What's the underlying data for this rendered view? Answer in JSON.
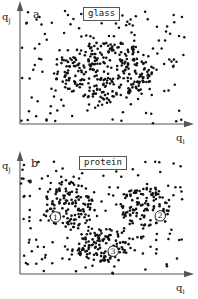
{
  "figure": {
    "background": "#ffffff",
    "dot_color": "#111111",
    "axis_color": "#555555"
  },
  "panels": [
    {
      "id": "a",
      "letter": "a",
      "tag": "glass",
      "xlabel": "q",
      "xlabel_sub": "i",
      "ylabel": "q",
      "ylabel_sub": "j"
    },
    {
      "id": "b",
      "letter": "b",
      "tag": "protein",
      "xlabel": "q",
      "xlabel_sub": "i",
      "ylabel": "q",
      "ylabel_sub": "j"
    }
  ],
  "cluster_markers": [
    {
      "label": "1",
      "panel": "b",
      "x": 52,
      "y": 212
    },
    {
      "label": "2",
      "panel": "b",
      "x": 160,
      "y": 214
    },
    {
      "label": "3",
      "panel": "b",
      "x": 111,
      "y": 257
    }
  ],
  "chart_data": {
    "type": "scatter",
    "title": "",
    "xlabel": "q_i",
    "ylabel": "q_j",
    "grid": false,
    "legend": "none",
    "axis_style": "arrow-axes-no-ticks",
    "xlim": [
      0,
      1
    ],
    "ylim": [
      0,
      1
    ],
    "panels": [
      {
        "name": "glass",
        "letter": "a",
        "description": "Sparse uniform background dots with one large dense amorphous cluster near the centre of configuration space.",
        "background_density_points": 120,
        "clusters": [
          {
            "id": "glass-central-blob",
            "label": "",
            "center": [
              0.52,
              0.46
            ],
            "radius_x": 0.3,
            "radius_y": 0.26,
            "n_points": 300
          }
        ]
      },
      {
        "name": "protein",
        "letter": "b",
        "description": "Sparse uniform background dots with three distinct dense clusters, each annotated by a circled number.",
        "background_density_points": 130,
        "clusters": [
          {
            "id": "protein-cluster-1",
            "label": "1",
            "center": [
              0.3,
              0.6
            ],
            "radius_x": 0.155,
            "radius_y": 0.195,
            "n_points": 120
          },
          {
            "id": "protein-cluster-2",
            "label": "2",
            "center": [
              0.76,
              0.585
            ],
            "radius_x": 0.155,
            "radius_y": 0.175,
            "n_points": 115
          },
          {
            "id": "protein-cluster-3",
            "label": "3",
            "center": [
              0.51,
              0.245
            ],
            "radius_x": 0.175,
            "radius_y": 0.145,
            "n_points": 120
          }
        ]
      }
    ]
  }
}
